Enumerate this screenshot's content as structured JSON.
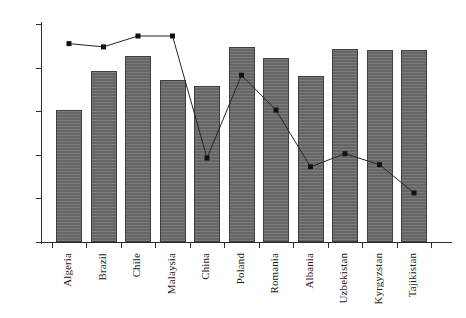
{
  "chart_data": {
    "type": "bar",
    "title": "",
    "subtitle": "",
    "xlabel": "",
    "ylabel": "",
    "ylim": [
      0,
      1
    ],
    "ytick_labels": [
      "0",
      "0.2",
      "0.4",
      "0.6",
      "0.8",
      "1"
    ],
    "ytick_values": [
      0,
      0.2,
      0.4,
      0.6,
      0.8,
      1
    ],
    "grid": false,
    "legend": null,
    "categories": [
      "Algeria",
      "Brazil",
      "Chile",
      "Malaysia",
      "China",
      "Poland",
      "Romania",
      "Albania",
      "Uzbekistan",
      "Kyrgyzstan",
      "Tajikistan"
    ],
    "series": [
      {
        "name": "bars",
        "type": "bar",
        "values": [
          0.605,
          0.785,
          0.855,
          0.745,
          0.715,
          0.895,
          0.845,
          0.76,
          0.885,
          0.88,
          0.88
        ]
      },
      {
        "name": "line",
        "type": "line",
        "marker": "square",
        "values": [
          0.91,
          0.895,
          0.945,
          0.945,
          0.385,
          0.765,
          0.605,
          0.345,
          0.405,
          0.355,
          0.225
        ]
      }
    ],
    "colors": {
      "bar_fill": "#6b6b6b",
      "bar_edge": "#3f3f3f",
      "line": "#262626",
      "marker": "#111111",
      "axis": "#2b2b2b",
      "background": "#ffffff"
    }
  }
}
